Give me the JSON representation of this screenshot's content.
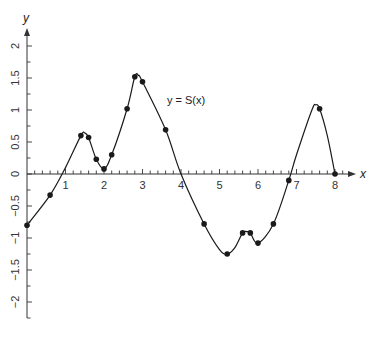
{
  "chart_data": {
    "type": "line",
    "title": "",
    "xlabel": "x",
    "ylabel": "y",
    "curve_label": "y = S(x)",
    "curve_label_pos": {
      "x": 3.4,
      "y": 1.1
    },
    "xlim": [
      0,
      8.3
    ],
    "ylim": [
      -2.25,
      2.25
    ],
    "x_ticks": [
      1,
      2,
      3,
      4,
      5,
      6,
      7,
      8
    ],
    "x_tick_labels": [
      "1",
      "2",
      "3",
      "4",
      "5",
      "6",
      "7",
      "8"
    ],
    "x_minor_step": 0.2,
    "y_ticks": [
      2,
      1.5,
      1,
      0.5,
      0,
      -0.5,
      -1,
      -1.5,
      -2
    ],
    "y_tick_labels": [
      "2",
      "1.5",
      "1",
      "0.5",
      "0",
      "−0.5",
      "−1",
      "−1.5",
      "−2"
    ],
    "grid": false,
    "legend": "none",
    "series": [
      {
        "name": "S(x) data points",
        "marker": "dot",
        "x": [
          0,
          0.6,
          1.4,
          1.6,
          1.8,
          2.0,
          2.2,
          2.6,
          2.8,
          3.0,
          3.6,
          4.6,
          5.2,
          5.6,
          5.8,
          6.0,
          6.4,
          6.8,
          7.6,
          8.0
        ],
        "y": [
          -0.8,
          -0.33,
          0.6,
          0.57,
          0.23,
          0.08,
          0.3,
          1.02,
          1.52,
          1.44,
          0.69,
          -0.78,
          -1.25,
          -0.92,
          -0.92,
          -1.08,
          -0.78,
          -0.1,
          1.02,
          0.0
        ]
      },
      {
        "name": "y = S(x) smooth curve",
        "marker": "none",
        "x": [
          0,
          0.6,
          1.0,
          1.4,
          1.5,
          1.6,
          1.8,
          2.0,
          2.2,
          2.6,
          2.8,
          2.9,
          3.0,
          3.6,
          4.0,
          4.6,
          5.0,
          5.2,
          5.4,
          5.6,
          5.7,
          5.8,
          6.0,
          6.4,
          6.8,
          7.0,
          7.4,
          7.5,
          7.6,
          7.8,
          8.0
        ],
        "y": [
          -0.8,
          -0.33,
          0.1,
          0.6,
          0.64,
          0.57,
          0.23,
          0.08,
          0.3,
          1.02,
          1.52,
          1.54,
          1.44,
          0.69,
          0.0,
          -0.78,
          -1.18,
          -1.25,
          -1.15,
          -0.92,
          -0.9,
          -0.92,
          -1.08,
          -0.78,
          -0.1,
          0.3,
          1.0,
          1.08,
          1.02,
          0.6,
          0.0
        ]
      }
    ]
  },
  "colors": {
    "line": "#1a1a1a",
    "axis": "#333333",
    "background": "#ffffff"
  }
}
